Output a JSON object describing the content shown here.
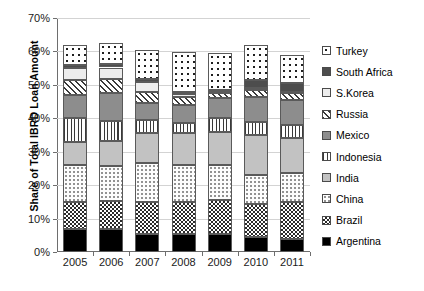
{
  "chart_data": {
    "type": "bar",
    "subtype": "stacked-bar",
    "title": "",
    "xlabel": "",
    "ylabel": "Share of Total IBRD Loan Amount",
    "ylim": [
      0,
      70
    ],
    "y_tick_labels": [
      "0%",
      "10%",
      "20%",
      "30%",
      "40%",
      "50%",
      "60%",
      "70%"
    ],
    "y_tick_values": [
      0,
      10,
      20,
      30,
      40,
      50,
      60,
      70
    ],
    "y_unit": "%",
    "grid": true,
    "legend_position": "right",
    "categories": [
      "2005",
      "2006",
      "2007",
      "2008",
      "2009",
      "2010",
      "2011"
    ],
    "series": [
      {
        "name": "Argentina",
        "pattern": "solid-black",
        "values": [
          7.0,
          7.0,
          5.5,
          5.5,
          5.5,
          4.5,
          4.0
        ]
      },
      {
        "name": "Brazil",
        "pattern": "checkerboard",
        "values": [
          8.0,
          8.2,
          9.5,
          9.5,
          10.0,
          10.0,
          11.0
        ]
      },
      {
        "name": "China",
        "pattern": "sparse-dots",
        "values": [
          11.0,
          10.5,
          11.5,
          11.0,
          10.5,
          8.5,
          8.5
        ]
      },
      {
        "name": "India",
        "pattern": "light-grey",
        "values": [
          7.0,
          7.5,
          9.0,
          9.5,
          10.0,
          12.0,
          10.5
        ]
      },
      {
        "name": "Indonesia",
        "pattern": "vertical-lines",
        "values": [
          7.0,
          6.0,
          4.0,
          3.0,
          4.0,
          4.0,
          4.0
        ]
      },
      {
        "name": "Mexico",
        "pattern": "medium-grey",
        "values": [
          7.0,
          8.5,
          5.0,
          5.5,
          6.0,
          7.5,
          7.5
        ]
      },
      {
        "name": "Russia",
        "pattern": "diagonal-hatch",
        "values": [
          4.5,
          4.0,
          3.5,
          2.5,
          1.5,
          2.0,
          2.0
        ]
      },
      {
        "name": "S.Korea",
        "pattern": "near-white",
        "values": [
          3.5,
          3.5,
          3.0,
          0.8,
          0.5,
          0.5,
          0.5
        ]
      },
      {
        "name": "South Africa",
        "pattern": "dark-grey",
        "values": [
          1.0,
          1.0,
          0.8,
          0.5,
          0.5,
          2.5,
          2.5
        ]
      },
      {
        "name": "Turkey",
        "pattern": "bold-open-dots",
        "values": [
          6.0,
          6.3,
          8.5,
          12.0,
          11.0,
          10.5,
          8.5
        ]
      }
    ],
    "totals": [
      62.0,
      62.5,
      60.3,
      59.8,
      59.5,
      62.0,
      59.0
    ]
  },
  "legend": {
    "items": [
      {
        "label": "Turkey",
        "key": "turkey"
      },
      {
        "label": "South Africa",
        "key": "southafrica"
      },
      {
        "label": "S.Korea",
        "key": "skorea"
      },
      {
        "label": "Russia",
        "key": "russia"
      },
      {
        "label": "Mexico",
        "key": "mexico"
      },
      {
        "label": "Indonesia",
        "key": "indonesia"
      },
      {
        "label": "India",
        "key": "india"
      },
      {
        "label": "China",
        "key": "china"
      },
      {
        "label": "Brazil",
        "key": "brazil"
      },
      {
        "label": "Argentina",
        "key": "argentina"
      }
    ]
  }
}
